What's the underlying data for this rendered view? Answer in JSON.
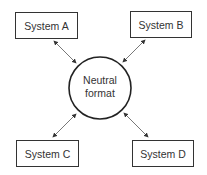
{
  "diagram": {
    "center": {
      "line1": "Neutral",
      "line2": "format"
    },
    "nodes": [
      {
        "id": "a",
        "label": "System A"
      },
      {
        "id": "b",
        "label": "System B"
      },
      {
        "id": "c",
        "label": "System C"
      },
      {
        "id": "d",
        "label": "System D"
      }
    ],
    "edges": [
      {
        "from": "a",
        "to": "center",
        "type": "bidirectional"
      },
      {
        "from": "b",
        "to": "center",
        "type": "bidirectional"
      },
      {
        "from": "c",
        "to": "center",
        "type": "bidirectional"
      },
      {
        "from": "d",
        "to": "center",
        "type": "bidirectional"
      }
    ],
    "colors": {
      "stroke": "#333333",
      "background": "#ffffff"
    }
  }
}
